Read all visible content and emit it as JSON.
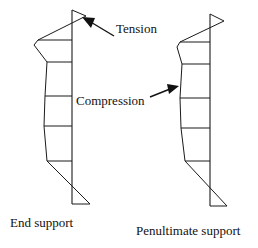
{
  "figure": {
    "background_color": "#ffffff",
    "line_color": "#1a1a1a",
    "width": 258,
    "height": 248
  },
  "annotations": {
    "tension": {
      "label": "Tension",
      "arrow_name": "tension-arrow",
      "points_to": "top of left diagram"
    },
    "compression": {
      "label": "Compression",
      "arrow_name": "compression-arrow",
      "points_to": "mid-left edge of right diagram"
    }
  },
  "captions": {
    "left": "End support",
    "right": "Penultimate support"
  },
  "diagrams": [
    {
      "name": "end-support-diagram",
      "caption": "End support",
      "axis": {
        "x": 72,
        "y_top": 10,
        "y_bottom": 204
      },
      "profile_points": [
        [
          72,
          10
        ],
        [
          84,
          17
        ],
        [
          38,
          40
        ],
        [
          35,
          44
        ],
        [
          47,
          62
        ],
        [
          45,
          96
        ],
        [
          44,
          126
        ],
        [
          47,
          160
        ],
        [
          89,
          204
        ],
        [
          72,
          204
        ]
      ],
      "tick_rows": [
        {
          "y": 40,
          "x_from": 38,
          "x_to": 72
        },
        {
          "y": 62,
          "x_from": 47,
          "x_to": 72
        },
        {
          "y": 96,
          "x_from": 45,
          "x_to": 72
        },
        {
          "y": 126,
          "x_from": 44,
          "x_to": 72
        },
        {
          "y": 160,
          "x_from": 47,
          "x_to": 72
        }
      ]
    },
    {
      "name": "penultimate-support-diagram",
      "caption": "Penultimate support",
      "axis": {
        "x": 210,
        "y_top": 14,
        "y_bottom": 206
      },
      "profile_points": [
        [
          210,
          14
        ],
        [
          222,
          22
        ],
        [
          180,
          42
        ],
        [
          178,
          46
        ],
        [
          182,
          64
        ],
        [
          180,
          98
        ],
        [
          181,
          128
        ],
        [
          184,
          160
        ],
        [
          226,
          206
        ],
        [
          210,
          206
        ]
      ],
      "tick_rows": [
        {
          "y": 42,
          "x_from": 180,
          "x_to": 210
        },
        {
          "y": 64,
          "x_from": 182,
          "x_to": 210
        },
        {
          "y": 98,
          "x_from": 180,
          "x_to": 210
        },
        {
          "y": 128,
          "x_from": 181,
          "x_to": 210
        },
        {
          "y": 160,
          "x_from": 184,
          "x_to": 210
        }
      ]
    }
  ]
}
